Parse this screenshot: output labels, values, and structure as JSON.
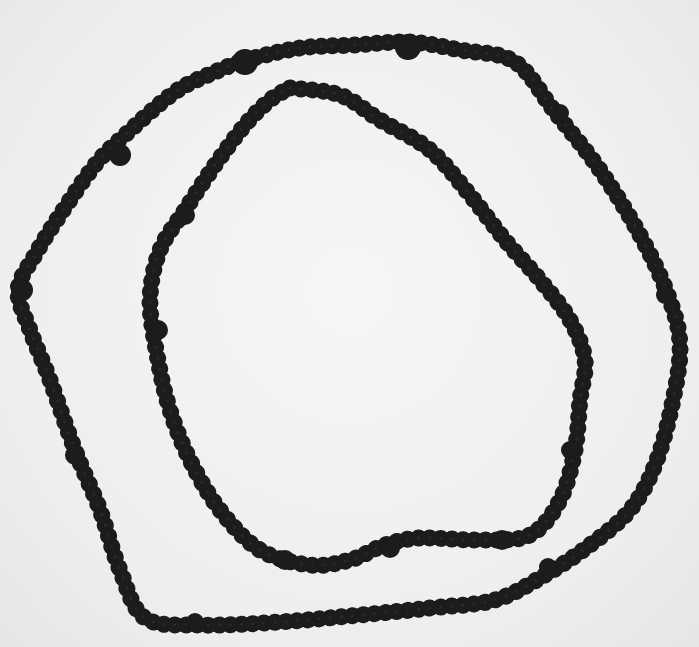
{
  "image": {
    "subject": "beaded necklace",
    "description": "Black-and-white photograph of a long dark beaded necklace arranged in two irregular concentric loops on a light background",
    "colors": {
      "background": "#f2f2f0",
      "beads": "#1a1a1a",
      "bead_highlight": "#3a3a3a"
    },
    "loops": [
      {
        "name": "outer-loop",
        "points": [
          [
            245,
            60
          ],
          [
            300,
            48
          ],
          [
            355,
            45
          ],
          [
            410,
            42
          ],
          [
            460,
            50
          ],
          [
            515,
            62
          ],
          [
            555,
            112
          ],
          [
            600,
            170
          ],
          [
            640,
            235
          ],
          [
            668,
            295
          ],
          [
            680,
            345
          ],
          [
            672,
            405
          ],
          [
            655,
            465
          ],
          [
            630,
            510
          ],
          [
            590,
            545
          ],
          [
            545,
            575
          ],
          [
            495,
            600
          ],
          [
            430,
            608
          ],
          [
            360,
            615
          ],
          [
            280,
            622
          ],
          [
            200,
            625
          ],
          [
            145,
            618
          ],
          [
            120,
            570
          ],
          [
            100,
            510
          ],
          [
            75,
            450
          ],
          [
            50,
            380
          ],
          [
            30,
            330
          ],
          [
            18,
            290
          ],
          [
            35,
            255
          ],
          [
            60,
            215
          ],
          [
            95,
            165
          ],
          [
            125,
            135
          ],
          [
            175,
            92
          ],
          [
            215,
            72
          ],
          [
            245,
            60
          ]
        ]
      },
      {
        "name": "inner-loop",
        "points": [
          [
            290,
            88
          ],
          [
            340,
            95
          ],
          [
            380,
            120
          ],
          [
            430,
            150
          ],
          [
            470,
            195
          ],
          [
            505,
            240
          ],
          [
            540,
            280
          ],
          [
            570,
            320
          ],
          [
            585,
            360
          ],
          [
            580,
            400
          ],
          [
            575,
            450
          ],
          [
            560,
            500
          ],
          [
            530,
            535
          ],
          [
            480,
            540
          ],
          [
            420,
            538
          ],
          [
            385,
            545
          ],
          [
            350,
            560
          ],
          [
            310,
            565
          ],
          [
            260,
            550
          ],
          [
            220,
            510
          ],
          [
            190,
            460
          ],
          [
            170,
            410
          ],
          [
            158,
            360
          ],
          [
            150,
            300
          ],
          [
            160,
            250
          ],
          [
            185,
            210
          ],
          [
            215,
            165
          ],
          [
            245,
            125
          ],
          [
            270,
            100
          ],
          [
            290,
            88
          ]
        ]
      }
    ],
    "accent_beads": [
      {
        "x": 245,
        "y": 62,
        "r": 13
      },
      {
        "x": 408,
        "y": 47,
        "r": 13
      },
      {
        "x": 120,
        "y": 155,
        "r": 11
      },
      {
        "x": 22,
        "y": 290,
        "r": 11
      },
      {
        "x": 185,
        "y": 215,
        "r": 10
      },
      {
        "x": 158,
        "y": 330,
        "r": 10
      },
      {
        "x": 560,
        "y": 113,
        "r": 9
      },
      {
        "x": 570,
        "y": 450,
        "r": 9
      },
      {
        "x": 502,
        "y": 540,
        "r": 10
      },
      {
        "x": 390,
        "y": 548,
        "r": 10
      },
      {
        "x": 285,
        "y": 560,
        "r": 10
      },
      {
        "x": 75,
        "y": 455,
        "r": 10
      },
      {
        "x": 665,
        "y": 295,
        "r": 9
      },
      {
        "x": 548,
        "y": 567,
        "r": 9
      },
      {
        "x": 195,
        "y": 622,
        "r": 9
      }
    ]
  }
}
